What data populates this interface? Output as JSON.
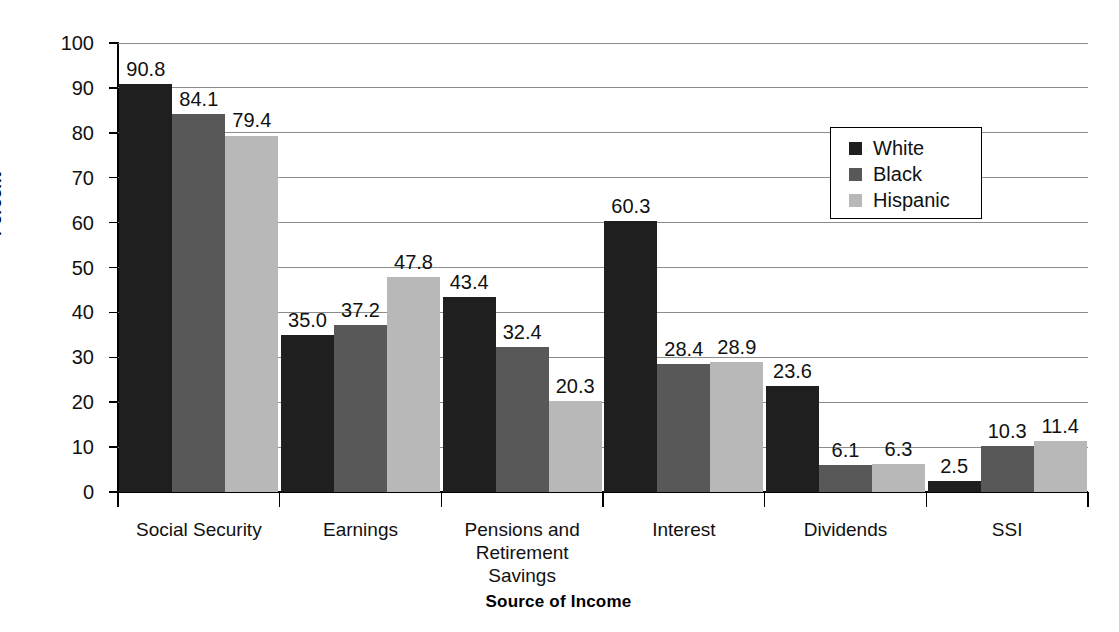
{
  "chart_data": {
    "type": "bar",
    "title": "",
    "xlabel": "Source of Income",
    "ylabel": "Percent",
    "ylim": [
      0,
      100
    ],
    "ytick_step": 10,
    "yticks": [
      "100",
      "90",
      "80",
      "70",
      "60",
      "50",
      "40",
      "30",
      "20",
      "10",
      "0"
    ],
    "grid": "horizontal",
    "legend_position": "upper-right-inside",
    "categories": [
      "Social Security",
      "Earnings",
      "Pensions and Retirement Savings",
      "Interest",
      "Dividends",
      "SSI"
    ],
    "category_label_lines": [
      [
        "Social Security"
      ],
      [
        "Earnings"
      ],
      [
        "Pensions and",
        "Retirement",
        "Savings"
      ],
      [
        "Interest"
      ],
      [
        "Dividends"
      ],
      [
        "SSI"
      ]
    ],
    "series": [
      {
        "name": "White",
        "color": "#1f1f1f",
        "values": [
          90.8,
          35.0,
          43.4,
          60.3,
          23.6,
          2.5
        ],
        "labels": [
          "90.8",
          "35.0",
          "43.4",
          "60.3",
          "23.6",
          "2.5"
        ]
      },
      {
        "name": "Black",
        "color": "#585858",
        "values": [
          84.1,
          37.2,
          32.4,
          28.4,
          6.1,
          10.3
        ],
        "labels": [
          "84.1",
          "37.2",
          "32.4",
          "28.4",
          "6.1",
          "10.3"
        ]
      },
      {
        "name": "Hispanic",
        "color": "#b8b8b8",
        "values": [
          79.4,
          47.8,
          20.3,
          28.9,
          6.3,
          11.4
        ],
        "labels": [
          "79.4",
          "47.8",
          "20.3",
          "28.9",
          "6.3",
          "11.4"
        ]
      }
    ]
  },
  "legend": {
    "items": [
      {
        "label": "White",
        "swatch": "#1f1f1f"
      },
      {
        "label": "Black",
        "swatch": "#585858"
      },
      {
        "label": "Hispanic",
        "swatch": "#b8b8b8"
      }
    ]
  },
  "axes": {
    "y_title": "Percent",
    "x_title": "Source of Income"
  }
}
